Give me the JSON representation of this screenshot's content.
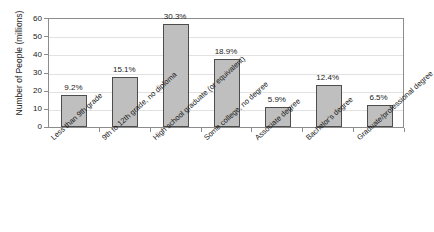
{
  "chart_data": {
    "type": "bar",
    "title": "",
    "subtitle": "",
    "xlabel": "",
    "ylabel": "Number of People (millions)",
    "ylim": [
      0,
      60
    ],
    "yticks": [
      0,
      10,
      20,
      30,
      40,
      50,
      60
    ],
    "grid": true,
    "legend": "none",
    "categories": [
      "Less than 9th grade",
      "9th to 12th grade, no diploma",
      "High school graduate (or equivalent)",
      "Some college, no degree",
      "Associate degree",
      "Bachelor's degree",
      "Graduate/professional degree"
    ],
    "values": [
      17.2,
      27.2,
      56.0,
      37.0,
      11.0,
      23.0,
      12.0
    ],
    "data_labels": [
      "9.2%",
      "15.1%",
      "30.3%",
      "18.9%",
      "5.9%",
      "12.4%",
      "6.5%"
    ],
    "percentages": [
      9.2,
      15.1,
      30.3,
      18.9,
      5.9,
      12.4,
      6.5
    ],
    "colors": {
      "bar_fill": "#bfbfbf",
      "bar_border": "#4d4d4d",
      "gridline": "#e2e2e2",
      "axis": "#8c8c8c",
      "text": "#1a1a1a",
      "background": "#ffffff"
    }
  }
}
